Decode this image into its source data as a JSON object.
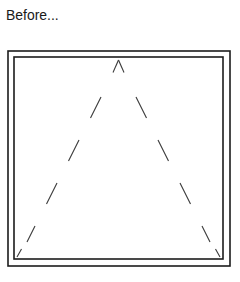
{
  "caption": {
    "text": "Before..."
  },
  "colors": {
    "background": "#ffffff",
    "text": "#1a1a1a",
    "frame_stroke": "#1c1c1c",
    "dash_stroke": "#3b3b3b"
  },
  "figure": {
    "name": "dashed-triangle-in-double-frame",
    "frame": {
      "type": "double-rectangle",
      "outer": {
        "x": 8,
        "y": 51,
        "width": 222,
        "height": 215
      },
      "inner": {
        "x": 14,
        "y": 57,
        "width": 209,
        "height": 202
      },
      "stroke_width": 1.6
    },
    "shape": {
      "type": "triangle",
      "style": "dashed",
      "apex": {
        "x": 118.5,
        "y": 60
      },
      "bottom_left": {
        "x": 17,
        "y": 257
      },
      "bottom_right": {
        "x": 220,
        "y": 257
      },
      "left_leg_dashes": [
        {
          "x1": 118.5,
          "y1": 60,
          "x2": 113.0,
          "y2": 72.5
        },
        {
          "x1": 101.0,
          "y1": 97.0,
          "x2": 90.5,
          "y2": 118.0
        },
        {
          "x1": 79.0,
          "y1": 140.0,
          "x2": 68.5,
          "y2": 161.0
        },
        {
          "x1": 57.0,
          "y1": 183.0,
          "x2": 46.5,
          "y2": 204.0
        },
        {
          "x1": 35.0,
          "y1": 226.0,
          "x2": 27.0,
          "y2": 242.0
        },
        {
          "x1": 21.5,
          "y1": 249.0,
          "x2": 17.0,
          "y2": 257.0
        }
      ],
      "right_leg_dashes": [
        {
          "x1": 118.5,
          "y1": 60,
          "x2": 124.0,
          "y2": 72.5
        },
        {
          "x1": 136.0,
          "y1": 97.0,
          "x2": 146.5,
          "y2": 118.0
        },
        {
          "x1": 158.0,
          "y1": 140.0,
          "x2": 168.5,
          "y2": 161.0
        },
        {
          "x1": 180.0,
          "y1": 183.0,
          "x2": 190.5,
          "y2": 204.0
        },
        {
          "x1": 202.0,
          "y1": 226.0,
          "x2": 210.0,
          "y2": 242.0
        },
        {
          "x1": 215.5,
          "y1": 249.0,
          "x2": 220.0,
          "y2": 257.0
        }
      ]
    }
  }
}
